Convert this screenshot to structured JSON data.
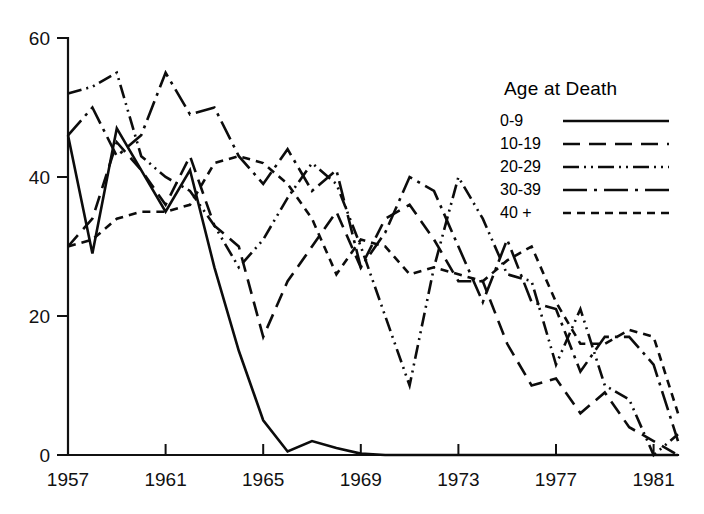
{
  "legend": {
    "title": "Age at Death",
    "entries": [
      {
        "label": "0-9",
        "dash": "none",
        "dasharray": ""
      },
      {
        "label": "10-19",
        "dash": "long-dash",
        "dasharray": "17 9"
      },
      {
        "label": "20-29",
        "dash": "dash-dot-dot",
        "dasharray": "16 5 2 5 2 5"
      },
      {
        "label": "30-39",
        "dash": "dash-dot",
        "dasharray": "24 7 3 7"
      },
      {
        "label": "40 +",
        "dash": "short-dash",
        "dasharray": "8 6"
      }
    ]
  },
  "chart_data": {
    "type": "line",
    "title": "",
    "xlabel": "",
    "ylabel": "",
    "xlim": [
      1957,
      1982
    ],
    "ylim": [
      0,
      60
    ],
    "yticks": [
      0,
      20,
      40,
      60
    ],
    "xticks": [
      1957,
      1961,
      1965,
      1969,
      1973,
      1977,
      1981
    ],
    "grid": false,
    "legend_position": "upper-right",
    "x": [
      1957,
      1958,
      1959,
      1960,
      1961,
      1962,
      1963,
      1964,
      1965,
      1966,
      1967,
      1968,
      1969,
      1970,
      1971,
      1972,
      1973,
      1974,
      1975,
      1976,
      1977,
      1978,
      1979,
      1980,
      1981,
      1982
    ],
    "series": [
      {
        "name": "0-9",
        "dash": "none",
        "values": [
          46,
          29,
          47,
          41,
          35,
          41,
          27,
          15,
          5,
          0.5,
          2,
          1,
          0.2,
          0,
          0,
          0,
          0,
          0,
          0,
          0,
          0,
          0,
          0,
          0,
          0,
          0
        ]
      },
      {
        "name": "10-19",
        "dash": "long-dash",
        "values": [
          30,
          34,
          45,
          41,
          36,
          43,
          33,
          30,
          17,
          25,
          30,
          35,
          27,
          34,
          36,
          31,
          25,
          25,
          16,
          10,
          11,
          6,
          9,
          4,
          2,
          0
        ]
      },
      {
        "name": "20-29",
        "dash": "dash-dot-dot",
        "values": [
          52,
          53,
          55,
          43,
          40,
          38,
          33,
          27,
          31,
          37,
          42,
          39,
          30,
          20,
          10,
          27,
          40,
          34,
          26,
          25,
          13,
          21,
          10,
          8,
          0,
          3
        ]
      },
      {
        "name": "30-39",
        "dash": "dash-dot",
        "values": [
          46,
          50,
          43,
          46,
          55,
          49,
          50,
          43,
          39,
          44,
          38,
          41,
          27,
          32,
          40,
          38,
          30,
          22,
          31,
          22,
          21,
          12,
          17,
          17,
          13,
          2
        ]
      },
      {
        "name": "40 +",
        "dash": "short-dash",
        "values": [
          30,
          31,
          34,
          35,
          35,
          36,
          42,
          43,
          42,
          39,
          34,
          26,
          31,
          30,
          26,
          27,
          26,
          25,
          28,
          30,
          22,
          16,
          16,
          18,
          17,
          6
        ]
      }
    ]
  }
}
